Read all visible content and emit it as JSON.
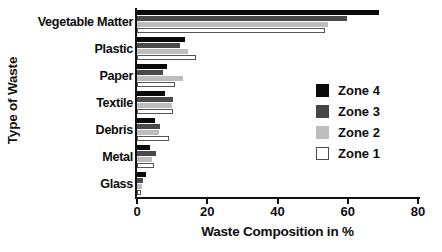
{
  "chart_data": {
    "type": "bar",
    "orientation": "horizontal",
    "title": "",
    "xlabel": "Waste Composition in %",
    "ylabel": "Type of Waste",
    "xlim": [
      0,
      80
    ],
    "xticks": [
      0,
      20,
      40,
      60,
      80
    ],
    "xtick_labels": [
      "0",
      "20",
      "40",
      "60",
      "80"
    ],
    "grid": false,
    "legend_position": "right",
    "categories": [
      "Vegetable Matter",
      "Plastic",
      "Paper",
      "Textile",
      "Debris",
      "Metal",
      "Glass"
    ],
    "series": [
      {
        "name": "Zone 4",
        "color": "#0a0a0a",
        "values": [
          69.0,
          13.7,
          8.5,
          8.0,
          5.1,
          3.8,
          2.5
        ]
      },
      {
        "name": "Zone 3",
        "color": "#4a4a4a",
        "values": [
          59.8,
          12.2,
          7.4,
          10.3,
          6.6,
          5.5,
          1.8
        ]
      },
      {
        "name": "Zone 2",
        "color": "#bdbdbd",
        "values": [
          54.5,
          14.5,
          13.1,
          10.0,
          6.3,
          4.4,
          1.5
        ]
      },
      {
        "name": "Zone 1",
        "color": "#ffffff",
        "values": [
          53.5,
          16.8,
          10.8,
          10.3,
          9.1,
          4.8,
          1.2
        ]
      }
    ]
  },
  "legend": {
    "items": [
      {
        "label": "Zone 4",
        "swatch": "z4"
      },
      {
        "label": "Zone 3",
        "swatch": "z3"
      },
      {
        "label": "Zone 2",
        "swatch": "z2"
      },
      {
        "label": "Zone 1",
        "swatch": "z1"
      }
    ]
  }
}
